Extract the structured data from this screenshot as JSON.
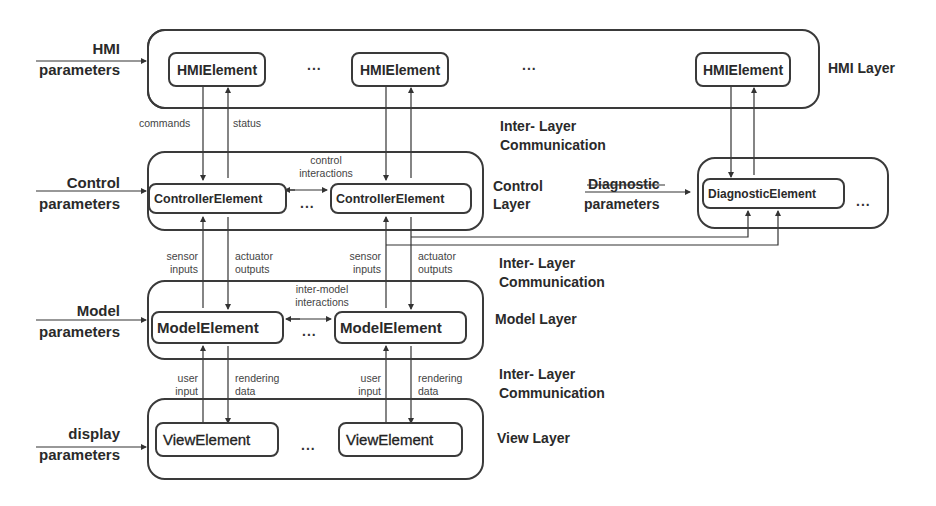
{
  "layers": {
    "hmi": {
      "label": "HMI  Layer",
      "param_line1": "HMI",
      "param_line2": "parameters",
      "elements": [
        "HMIElement",
        "HMIElement",
        "HMIElement"
      ],
      "ellipsis": [
        "...",
        "..."
      ]
    },
    "control": {
      "label_line1": "Control",
      "label_line2": "Layer",
      "param_line1": "Control",
      "param_line2": "parameters",
      "elements": [
        "ControllerElement",
        "ControllerElement"
      ],
      "ellipsis": "...",
      "interaction_line1": "control",
      "interaction_line2": "interactions"
    },
    "diagnostic": {
      "param_line1": "Diagnostic",
      "param_line2": "parameters",
      "element": "DiagnosticElement",
      "ellipsis": "..."
    },
    "model": {
      "label": "Model  Layer",
      "param_line1": "Model",
      "param_line2": "parameters",
      "elements": [
        "ModelElement",
        "ModelElement"
      ],
      "ellipsis": "...",
      "interaction_line1": "inter-model",
      "interaction_line2": "interactions"
    },
    "view": {
      "label": "View  Layer",
      "param_line1": "display",
      "param_line2": "parameters",
      "elements": [
        "ViewElement",
        "ViewElement"
      ],
      "ellipsis": "..."
    }
  },
  "inter_layer": {
    "line1": "Inter- Layer",
    "line2": "Communication"
  },
  "flows": {
    "commands": "commands",
    "status": "status",
    "sensor_line1": "sensor",
    "sensor_line2": "inputs",
    "actuator_line1": "actuator",
    "actuator_line2": "outputs",
    "user_line1": "user",
    "user_line2": "input",
    "rendering_line1": "rendering",
    "rendering_line2": "data"
  }
}
